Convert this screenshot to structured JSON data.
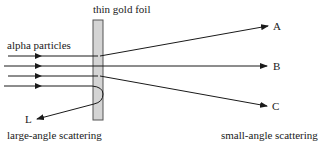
{
  "diagram": {
    "labels": {
      "foil": "thin gold foil",
      "source": "alpha particles",
      "path_a": "A",
      "path_b": "B",
      "path_c": "C",
      "path_l": "L",
      "large_angle": "large-angle scattering",
      "small_angle": "small-angle scattering"
    },
    "colors": {
      "foil_fill": "#d4d4d4",
      "foil_stroke": "#555555",
      "line": "#1a1a1a"
    }
  }
}
